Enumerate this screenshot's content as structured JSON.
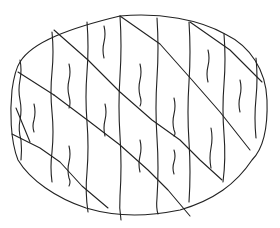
{
  "drawing": {
    "subject": "oval with diagonal stripes and wavy vertical lines",
    "stroke_color": "#222222",
    "background_color": "#ffffff"
  }
}
